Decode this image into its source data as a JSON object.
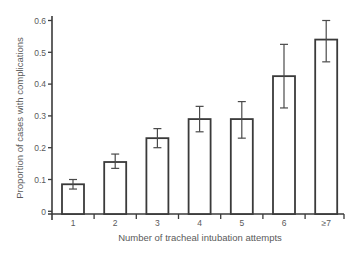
{
  "chart_data": {
    "type": "bar",
    "title": "",
    "xlabel": "Number of tracheal intubation attempts",
    "ylabel": "Proportion of cases with complications",
    "categories": [
      "1",
      "2",
      "3",
      "4",
      "5",
      "6",
      "≥7"
    ],
    "values": [
      0.085,
      0.155,
      0.23,
      0.29,
      0.29,
      0.425,
      0.54
    ],
    "error_low": [
      0.07,
      0.135,
      0.2,
      0.25,
      0.23,
      0.325,
      0.47
    ],
    "error_high": [
      0.1,
      0.18,
      0.26,
      0.33,
      0.345,
      0.525,
      0.6
    ],
    "ylim": [
      0,
      0.6
    ],
    "yticks": [
      0,
      0.1,
      0.2,
      0.3,
      0.4,
      0.5,
      0.6
    ],
    "ytick_labels": [
      "0",
      "0.1",
      "0.2",
      "0.3",
      "0.4",
      "0.5",
      "0.6"
    ],
    "grid": false,
    "legend": null,
    "bar_fill": "#ffffff",
    "bar_stroke": "#3a3a3a",
    "text_color": "#5a5a5a"
  }
}
